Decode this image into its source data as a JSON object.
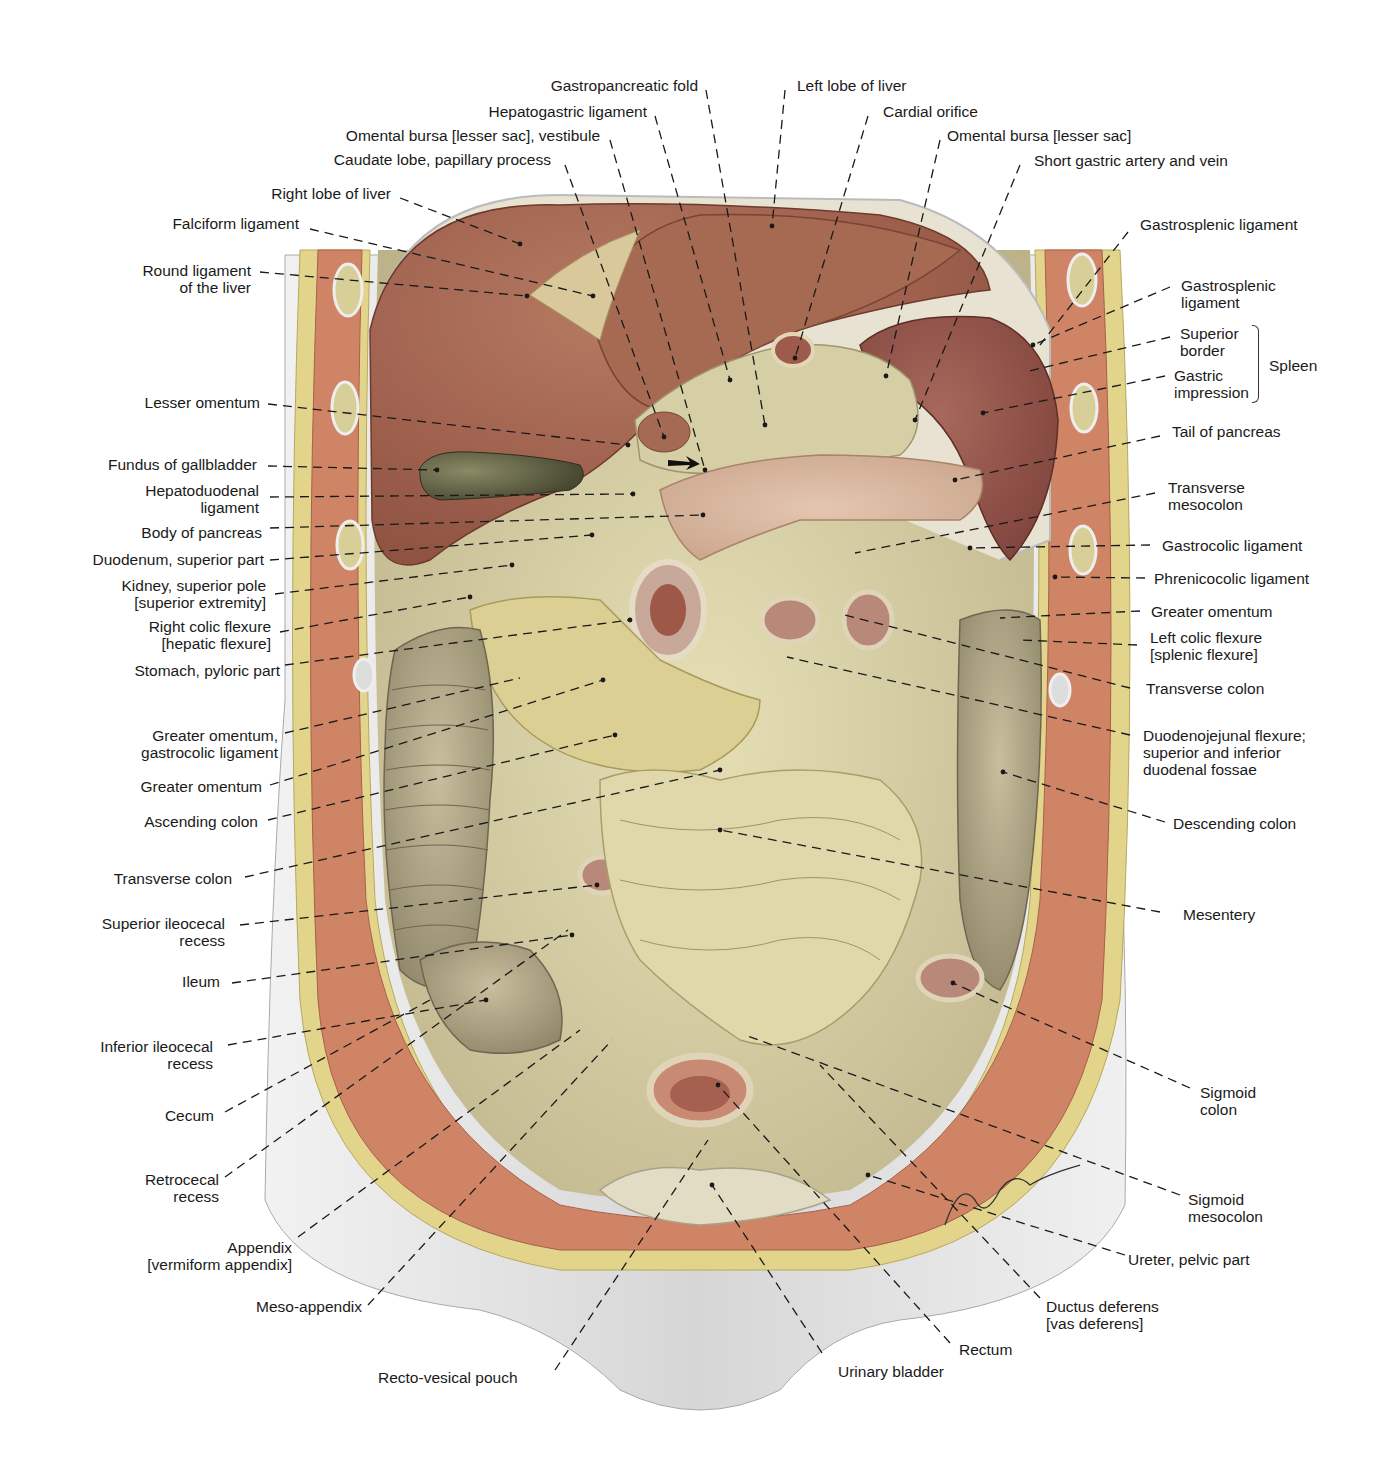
{
  "figure": {
    "signature": "Lesser"
  },
  "colors": {
    "liver": "#9a5a44",
    "liver_light": "#b87a60",
    "spleen": "#8c4e44",
    "mesentery": "#d9d2a4",
    "intestine": "#b8ad8c",
    "fat": "#e2d48a",
    "muscle": "#cf8466",
    "skin": "#dcdcdc",
    "gallbladder": "#5a5a40",
    "leader": "#1a1a1a"
  },
  "labels": {
    "top": [
      {
        "id": "gastropancreatic-fold",
        "text": "Gastropancreatic fold"
      },
      {
        "id": "left-lobe-liver",
        "text": "Left lobe of liver"
      },
      {
        "id": "hepatogastric-ligament",
        "text": "Hepatogastric ligament"
      },
      {
        "id": "cardial-orifice",
        "text": "Cardial orifice"
      },
      {
        "id": "omental-bursa-vestibule",
        "text": "Omental bursa [lesser sac], vestibule"
      },
      {
        "id": "omental-bursa",
        "text": "Omental bursa [lesser sac]"
      },
      {
        "id": "caudate-lobe",
        "text": "Caudate lobe, papillary process"
      },
      {
        "id": "short-gastric",
        "text": "Short gastric artery and vein"
      }
    ],
    "left": [
      {
        "id": "right-lobe-liver",
        "text": "Right lobe of liver"
      },
      {
        "id": "falciform-ligament",
        "text": "Falciform ligament"
      },
      {
        "id": "round-ligament",
        "line1": "Round ligament",
        "line2": "of the liver"
      },
      {
        "id": "lesser-omentum",
        "text": "Lesser omentum"
      },
      {
        "id": "fundus-gallbladder",
        "text": "Fundus of gallbladder"
      },
      {
        "id": "hepatoduodenal-ligament",
        "line1": "Hepatoduodenal",
        "line2": "ligament"
      },
      {
        "id": "body-pancreas",
        "text": "Body of pancreas"
      },
      {
        "id": "duodenum-superior",
        "text": "Duodenum, superior part"
      },
      {
        "id": "kidney-superior-pole",
        "line1": "Kidney, superior pole",
        "line2": "[superior extremity]"
      },
      {
        "id": "right-colic-flexure",
        "line1": "Right colic flexure",
        "line2": "[hepatic flexure]"
      },
      {
        "id": "stomach-pyloric",
        "text": "Stomach, pyloric part"
      },
      {
        "id": "greater-omentum-gastrocolic",
        "line1": "Greater omentum,",
        "line2": "gastrocolic ligament"
      },
      {
        "id": "greater-omentum-left",
        "text": "Greater omentum"
      },
      {
        "id": "ascending-colon",
        "text": "Ascending colon"
      },
      {
        "id": "transverse-colon-left",
        "text": "Transverse colon"
      },
      {
        "id": "superior-ileocecal",
        "line1": "Superior ileocecal",
        "line2": "recess"
      },
      {
        "id": "ileum",
        "text": "Ileum"
      },
      {
        "id": "inferior-ileocecal",
        "line1": "Inferior ileocecal",
        "line2": "recess"
      },
      {
        "id": "cecum",
        "text": "Cecum"
      },
      {
        "id": "retrocecal",
        "line1": "Retrocecal",
        "line2": "recess"
      },
      {
        "id": "appendix",
        "line1": "Appendix",
        "line2": "[vermiform appendix]"
      },
      {
        "id": "meso-appendix",
        "text": "Meso-appendix"
      }
    ],
    "right": [
      {
        "id": "gastrosplenic-1",
        "text": "Gastrosplenic ligament"
      },
      {
        "id": "gastrosplenic-2",
        "line1": "Gastrosplenic",
        "line2": "ligament"
      },
      {
        "id": "superior-border",
        "line1": "Superior",
        "line2": "border"
      },
      {
        "id": "gastric-impression",
        "line1": "Gastric",
        "line2": "impression"
      },
      {
        "id": "spleen",
        "text": "Spleen"
      },
      {
        "id": "tail-pancreas",
        "text": "Tail of pancreas"
      },
      {
        "id": "transverse-mesocolon",
        "line1": "Transverse",
        "line2": "mesocolon"
      },
      {
        "id": "gastrocolic-ligament",
        "text": "Gastrocolic ligament"
      },
      {
        "id": "phrenicocolic-ligament",
        "text": "Phrenicocolic ligament"
      },
      {
        "id": "greater-omentum-right",
        "text": "Greater omentum"
      },
      {
        "id": "left-colic-flexure",
        "line1": "Left colic flexure",
        "line2": "[splenic flexure]"
      },
      {
        "id": "transverse-colon-right",
        "text": "Transverse colon"
      },
      {
        "id": "duodenojejunal",
        "line1": "Duodenojejunal flexure;",
        "line2": "superior and inferior",
        "line3": "duodenal fossae"
      },
      {
        "id": "descending-colon",
        "text": "Descending colon"
      },
      {
        "id": "mesentery",
        "text": "Mesentery"
      },
      {
        "id": "sigmoid-colon",
        "line1": "Sigmoid",
        "line2": "colon"
      },
      {
        "id": "sigmoid-mesocolon",
        "line1": "Sigmoid",
        "line2": "mesocolon"
      },
      {
        "id": "ureter-pelvic",
        "text": "Ureter, pelvic part"
      },
      {
        "id": "ductus-deferens",
        "line1": "Ductus deferens",
        "line2": "[vas deferens]"
      },
      {
        "id": "rectum",
        "text": "Rectum"
      },
      {
        "id": "urinary-bladder",
        "text": "Urinary bladder"
      },
      {
        "id": "recto-vesical-pouch",
        "text": "Recto-vesical pouch"
      }
    ]
  }
}
